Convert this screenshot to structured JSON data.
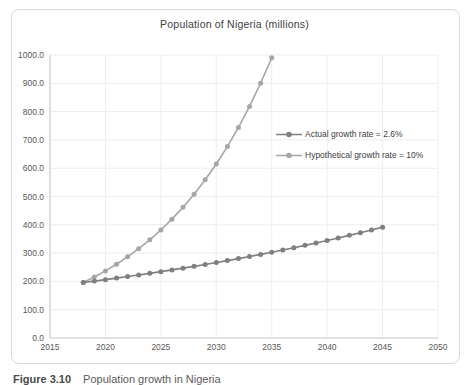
{
  "figure": {
    "title": "Population of Nigeria (millions)",
    "caption_label": "Figure 3.10",
    "caption_text": "Population growth in Nigeria"
  },
  "colors": {
    "actual_series": "#7f7f7f",
    "hypothetical_series": "#a6a6a6",
    "gridline": "#ededed",
    "axis_line": "#c6c6c6",
    "tick_text": "#595959",
    "title_text": "#404040",
    "frame_border": "#d9d9d9"
  },
  "chart_data": {
    "type": "line",
    "title": "Population of Nigeria (millions)",
    "xlabel": "",
    "ylabel": "",
    "xlim": [
      2015,
      2050
    ],
    "ylim": [
      0,
      1000
    ],
    "xticks": [
      2015,
      2020,
      2025,
      2030,
      2035,
      2040,
      2045,
      2050
    ],
    "yticks": [
      0,
      100,
      200,
      300,
      400,
      500,
      600,
      700,
      800,
      900,
      1000
    ],
    "ytick_labels": [
      "0.0",
      "100.0",
      "200.0",
      "300.0",
      "400.0",
      "500.0",
      "600.0",
      "700.0",
      "800.0",
      "900.0",
      "1000.0"
    ],
    "grid": true,
    "legend_position": "inside-right",
    "series": [
      {
        "name": "Actual growth rate = 2.6%",
        "color": "#7f7f7f",
        "x": [
          2018,
          2019,
          2020,
          2021,
          2022,
          2023,
          2024,
          2025,
          2026,
          2027,
          2028,
          2029,
          2030,
          2031,
          2032,
          2033,
          2034,
          2035,
          2036,
          2037,
          2038,
          2039,
          2040,
          2041,
          2042,
          2043,
          2044,
          2045
        ],
        "values": [
          195.9,
          201.0,
          206.2,
          211.6,
          217.1,
          222.7,
          228.5,
          234.5,
          240.6,
          246.8,
          253.2,
          259.8,
          266.6,
          273.5,
          280.6,
          287.9,
          295.4,
          303.1,
          311.0,
          319.0,
          327.3,
          335.8,
          344.6,
          353.5,
          362.7,
          372.1,
          381.8,
          391.7
        ]
      },
      {
        "name": "Hypothetical growth rate = 10%",
        "color": "#a6a6a6",
        "x": [
          2018,
          2019,
          2020,
          2021,
          2022,
          2023,
          2024,
          2025,
          2026,
          2027,
          2028,
          2029,
          2030,
          2031,
          2032,
          2033,
          2034,
          2035
        ],
        "values": [
          195.9,
          215.5,
          237.0,
          260.7,
          286.8,
          315.5,
          347.0,
          381.7,
          419.9,
          461.9,
          508.1,
          558.9,
          614.8,
          676.3,
          743.9,
          818.3,
          900.1,
          990.1
        ]
      }
    ]
  }
}
